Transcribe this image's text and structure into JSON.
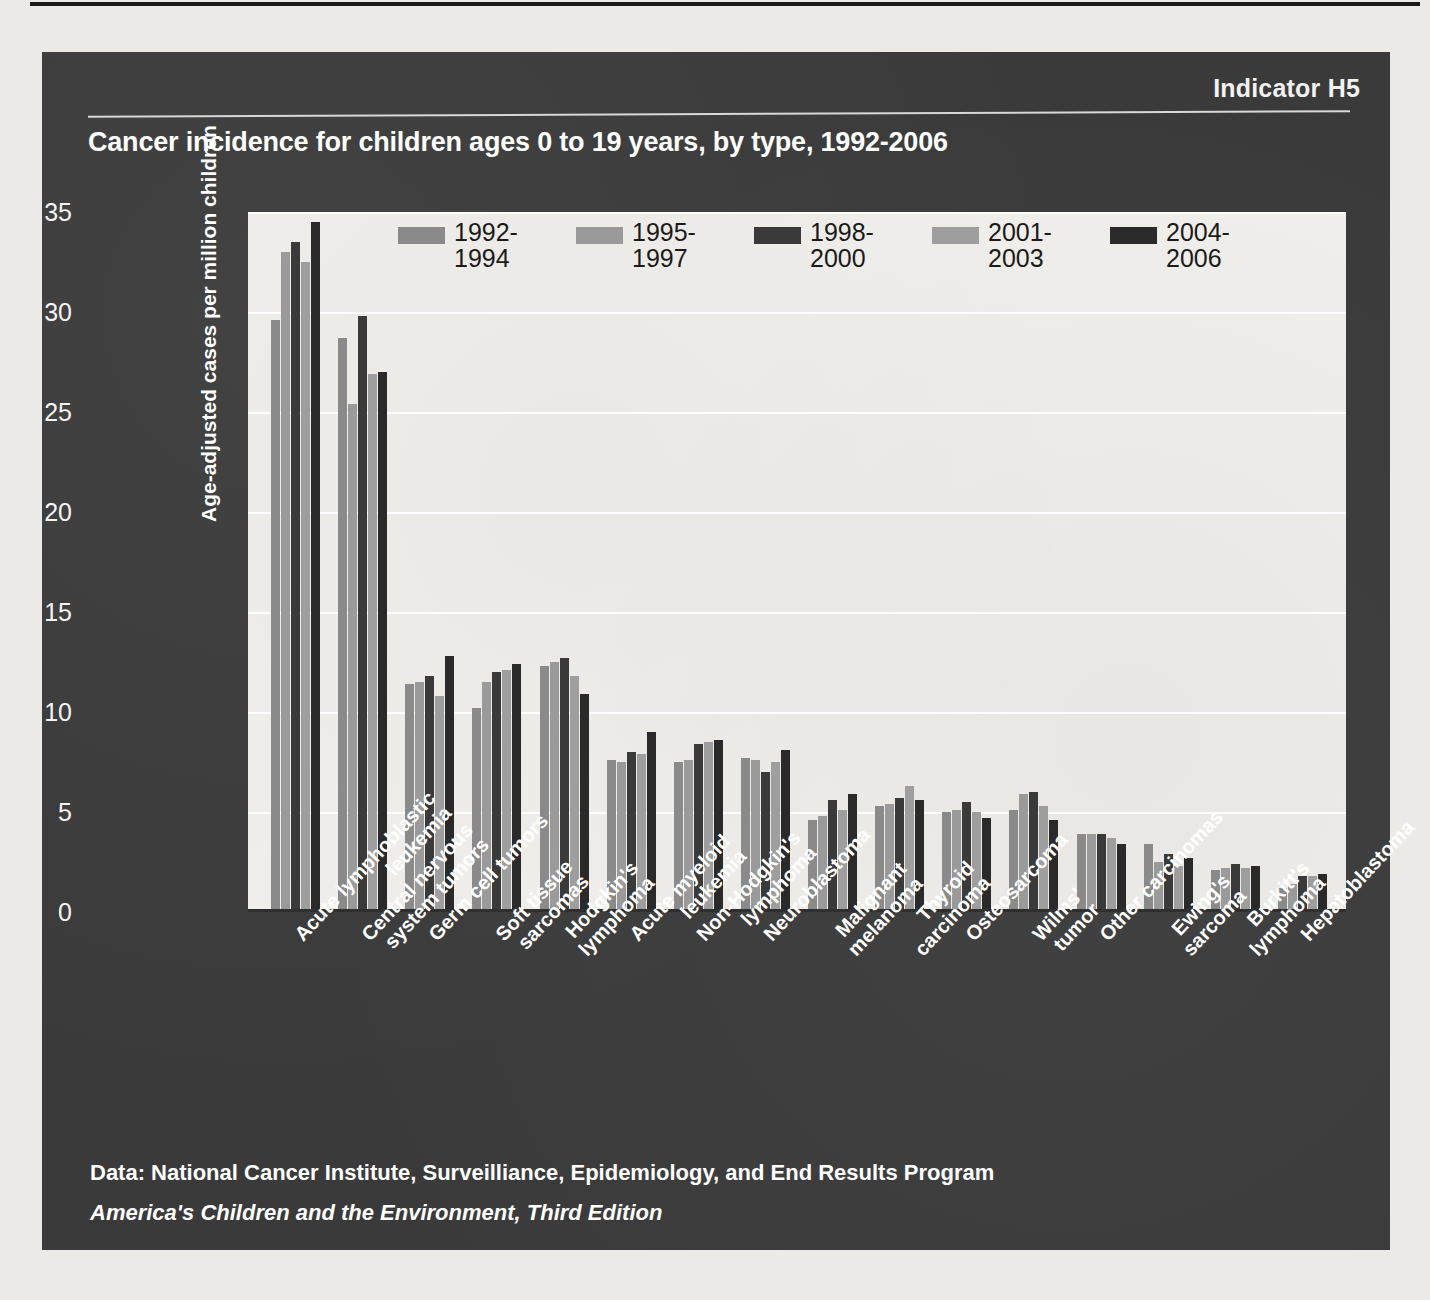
{
  "indicator": "Indicator H5",
  "title": "Cancer incidence for children ages 0 to 19 years, by type, 1992-2006",
  "source": "Data: National Cancer Institute, Surveilliance, Epidemiology, and End Results Program",
  "edition": "America's Children and the Environment, Third Edition",
  "colors": {
    "panel_bg": "#3a3a3a",
    "plot_bg": "#f0eeea",
    "series": [
      "#8a8a8a",
      "#9a9a9a",
      "#3a3a3a",
      "#9e9e9e",
      "#2a2a2a"
    ]
  },
  "chart_data": {
    "type": "bar",
    "title": "Cancer incidence for children ages 0 to 19 years, by type, 1992-2006",
    "xlabel": "",
    "ylabel": "Age-adjusted cases per million children",
    "ylim": [
      0,
      35
    ],
    "yticks": [
      0,
      5,
      10,
      15,
      20,
      25,
      30,
      35
    ],
    "grid": true,
    "legend_position": "top-inside",
    "categories": [
      "Acute lymphoblastic leukemia",
      "Central nervous system tumors",
      "Germ cell tumors",
      "Soft tissue sarcomas",
      "Hodgkin's lymphoma",
      "Acute myeloid leukemia",
      "Non-Hodgkin's lymphoma",
      "Neuroblastoma",
      "Malignant melanoma",
      "Thyroid carcinoma",
      "Osteosarcoma",
      "Wilms' tumor",
      "Other carcinomas",
      "Ewing's sarcoma",
      "Burkitt's lymphoma",
      "Hepatoblastoma"
    ],
    "categories_wrapped": [
      [
        "Acute lymphoblastic",
        "leukemia"
      ],
      [
        "Central nervous",
        "system tumors"
      ],
      [
        "Germ cell tumors"
      ],
      [
        "Soft tissue",
        "sarcomas"
      ],
      [
        "Hodgkin's",
        "lymphoma"
      ],
      [
        "Acute myeloid",
        "leukemia"
      ],
      [
        "Non-Hodgkin's",
        "lymphoma"
      ],
      [
        "Neuroblastoma"
      ],
      [
        "Malignant",
        "melanoma"
      ],
      [
        "Thyroid",
        "carcinoma"
      ],
      [
        "Osteosarcoma"
      ],
      [
        "Wilms'",
        "tumor"
      ],
      [
        "Other carcinomas"
      ],
      [
        "Ewing's",
        "sarcoma"
      ],
      [
        "Burkitt's",
        "lymphoma"
      ],
      [
        "Hepatoblastoma"
      ]
    ],
    "series": [
      {
        "name": "1992-1994",
        "label_lines": [
          "1992-",
          "1994"
        ],
        "color": "#8a8a8a",
        "values": [
          29.6,
          28.7,
          11.4,
          10.2,
          12.3,
          7.6,
          7.5,
          7.7,
          4.6,
          5.3,
          5.0,
          5.1,
          3.9,
          3.4,
          2.1,
          1.2
        ]
      },
      {
        "name": "1995-1997",
        "label_lines": [
          "1995-",
          "1997"
        ],
        "color": "#9a9a9a",
        "values": [
          33.0,
          25.4,
          11.5,
          11.5,
          12.5,
          7.5,
          7.6,
          7.6,
          4.8,
          5.4,
          5.1,
          5.9,
          3.9,
          2.5,
          2.2,
          1.4
        ]
      },
      {
        "name": "1998-2000",
        "label_lines": [
          "1998-",
          "2000"
        ],
        "color": "#3a3a3a",
        "values": [
          33.5,
          29.8,
          11.8,
          12.0,
          12.7,
          8.0,
          8.4,
          7.0,
          5.6,
          5.7,
          5.5,
          6.0,
          3.9,
          2.9,
          2.4,
          1.8
        ]
      },
      {
        "name": "2001-2003",
        "label_lines": [
          "2001-",
          "2003"
        ],
        "color": "#9e9e9e",
        "values": [
          32.5,
          26.9,
          10.8,
          12.1,
          11.8,
          7.9,
          8.5,
          7.5,
          5.1,
          6.3,
          5.0,
          5.3,
          3.7,
          2.3,
          2.2,
          1.8
        ]
      },
      {
        "name": "2004-2006",
        "label_lines": [
          "2004-",
          "2006"
        ],
        "color": "#2a2a2a",
        "values": [
          34.5,
          27.0,
          12.8,
          12.4,
          10.9,
          9.0,
          8.6,
          8.1,
          5.9,
          5.6,
          4.7,
          4.6,
          3.4,
          2.7,
          2.3,
          1.9
        ]
      }
    ]
  }
}
